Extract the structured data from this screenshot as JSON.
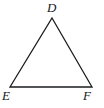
{
  "figure": {
    "type": "geometry-diagram",
    "shape": "triangle",
    "background_color": "#ffffff",
    "stroke_color": "#1a1c1e",
    "stroke_width": 1.3,
    "canvas": {
      "width": 104,
      "height": 108
    },
    "vertices": [
      {
        "id": "D",
        "label": "D",
        "x": 52,
        "y": 18,
        "position": "apex-top"
      },
      {
        "id": "E",
        "label": "E",
        "x": 10,
        "y": 87,
        "position": "bottom-left"
      },
      {
        "id": "F",
        "label": "F",
        "x": 92,
        "y": 87,
        "position": "bottom-right"
      }
    ],
    "edges": [
      {
        "from": "E",
        "to": "D"
      },
      {
        "from": "D",
        "to": "F"
      },
      {
        "from": "E",
        "to": "F"
      }
    ],
    "label_style": {
      "font_style": "italic",
      "font_size_px": 13,
      "color": "#16181a"
    }
  }
}
